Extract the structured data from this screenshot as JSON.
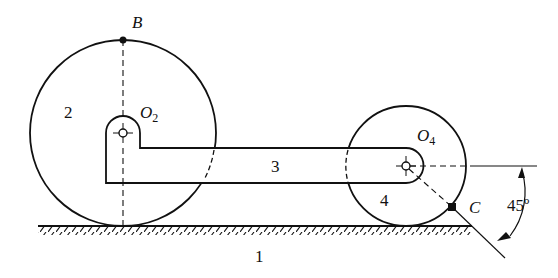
{
  "diagram": {
    "type": "mechanism",
    "labels": {
      "ground": "1",
      "wheel_large": "2",
      "link": "3",
      "wheel_small": "4",
      "point_B": "B",
      "pivot_O2_main": "O",
      "pivot_O2_sub": "2",
      "pivot_O4_main": "O",
      "pivot_O4_sub": "4",
      "point_C": "C",
      "angle": "45º"
    },
    "colors": {
      "stroke": "#111111",
      "background": "#ffffff"
    }
  }
}
